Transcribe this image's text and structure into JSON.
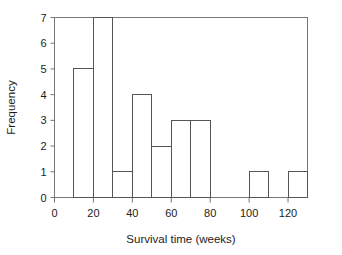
{
  "chart_data": {
    "type": "bar",
    "title": "",
    "subtitle": "",
    "xlabel": "Survival time (weeks)",
    "ylabel": "Frequency",
    "xlim": [
      0,
      130
    ],
    "ylim": [
      0,
      7
    ],
    "grid": false,
    "legend": null,
    "bin_width": 10,
    "bin_edges": [
      10,
      20,
      30,
      40,
      50,
      60,
      70,
      80,
      100,
      110,
      120,
      130
    ],
    "categories": [
      "10-20",
      "20-30",
      "30-40",
      "40-50",
      "50-60",
      "60-70",
      "70-80",
      "80-90",
      "90-100",
      "100-110",
      "110-120",
      "120-130"
    ],
    "values": [
      5,
      7,
      1,
      4,
      2,
      3,
      3,
      0,
      0,
      1,
      0,
      1
    ],
    "bars": [
      {
        "x0": 10,
        "x1": 20,
        "height": 5
      },
      {
        "x0": 20,
        "x1": 30,
        "height": 7
      },
      {
        "x0": 30,
        "x1": 40,
        "height": 1
      },
      {
        "x0": 40,
        "x1": 50,
        "height": 4
      },
      {
        "x0": 50,
        "x1": 60,
        "height": 2
      },
      {
        "x0": 60,
        "x1": 70,
        "height": 3
      },
      {
        "x0": 70,
        "x1": 80,
        "height": 3
      },
      {
        "x0": 80,
        "x1": 90,
        "height": 0
      },
      {
        "x0": 90,
        "x1": 100,
        "height": 0
      },
      {
        "x0": 100,
        "x1": 110,
        "height": 1
      },
      {
        "x0": 110,
        "x1": 120,
        "height": 0
      },
      {
        "x0": 120,
        "x1": 130,
        "height": 1
      }
    ],
    "x_ticks": [
      0,
      20,
      40,
      60,
      80,
      100,
      120
    ],
    "x_tick_labels": [
      "0",
      "20",
      "40",
      "60",
      "80",
      "100",
      "120"
    ],
    "y_ticks": [
      0,
      1,
      2,
      3,
      4,
      5,
      6,
      7
    ],
    "y_tick_labels": [
      "0",
      "1",
      "2",
      "3",
      "4",
      "5",
      "6",
      "7"
    ],
    "colors": {
      "bar_fill": "#ffffff",
      "bar_stroke": "#555555",
      "axis": "#777777",
      "text": "#1c1c1c",
      "background": "#ffffff"
    }
  }
}
